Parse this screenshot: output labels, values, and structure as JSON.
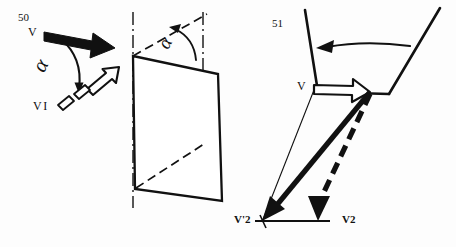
{
  "figure": {
    "kind": "technical-line-drawing",
    "title": "",
    "background_color": "#fdfdfd",
    "ink_color": "#111111",
    "width": 456,
    "height": 247
  },
  "labels": {
    "ref_50": "50",
    "vector_v_left": "V",
    "vector_v1": "VI",
    "angle_alpha_left": "α",
    "angle_alpha_middle": "α",
    "ref_51": "51",
    "vector_v_right": "V",
    "vector_v_prime_2": "V'2",
    "vector_v2": "V2"
  },
  "panels": [
    {
      "name": "left-vector-rotation",
      "description": "Solid black velocity arrow V rotated by angle alpha into hollow outlined arrow V1 with dashed segmented tail",
      "elements": [
        "solid-black-arrow-V",
        "curved-rotation-arrow-alpha",
        "hollow-outlined-arrow-V1",
        "dashed-tail-segments"
      ]
    },
    {
      "name": "middle-inclined-plane",
      "description": "Three-dimensional parallelogram plane with vertical dash-dot axes and angle alpha between dashed diagonal and vertical reference",
      "elements": [
        "plane-parallelogram",
        "vertical-dashdot-axis-left",
        "vertical-dashdot-axis-right",
        "dashed-diagonal-upper",
        "dashed-diagonal-lower",
        "alpha-arc-arrow"
      ]
    },
    {
      "name": "right-vessel-vector-triangle",
      "description": "Vessel cross-section with inward circulation arrow; hollow arrow at point V and vector triangle resolving into V'2 solid and V2 dashed components on a horizontal baseline",
      "elements": [
        "vessel-outline",
        "circulation-arrow",
        "hollow-outlined-arrow-V",
        "thin-construction-line",
        "solid-vector-to-Vprime2",
        "dashed-vector-to-V2",
        "horizontal-baseline"
      ]
    }
  ]
}
